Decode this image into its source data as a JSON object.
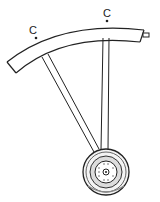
{
  "diagram": {
    "type": "mechanical line drawing",
    "labels": [
      {
        "id": "c-left",
        "text": "C"
      },
      {
        "id": "c-right",
        "text": "C"
      }
    ],
    "parts": [
      "curved scale arc",
      "end pin",
      "left rod",
      "right rod",
      "hub wheel"
    ],
    "colors": {
      "line": "#222222",
      "background": "#ffffff",
      "shade": "#888888"
    }
  }
}
